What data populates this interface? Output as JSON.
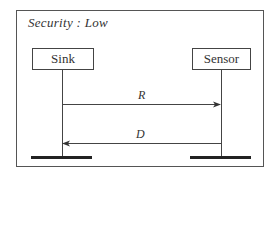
{
  "diagram": {
    "type": "sequence",
    "title": "Security : Low",
    "actors": [
      {
        "id": "sink",
        "label": "Sink"
      },
      {
        "id": "sensor",
        "label": "Sensor"
      }
    ],
    "messages": [
      {
        "label": "R",
        "from": "Sink",
        "to": "Sensor"
      },
      {
        "label": "D",
        "from": "Sensor",
        "to": "Sink"
      }
    ],
    "colors": {
      "line": "#444444",
      "ground": "#222222",
      "background": "#ffffff"
    }
  }
}
